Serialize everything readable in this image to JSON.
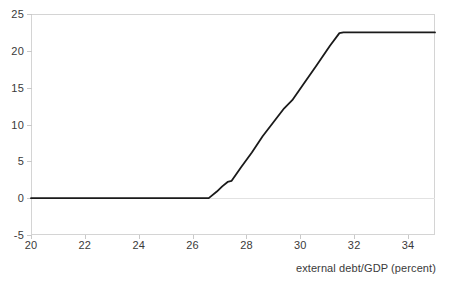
{
  "chart_data": {
    "type": "line",
    "title": "",
    "subtitle": "",
    "xlabel": "external debt/GDP (percent)",
    "ylabel": "",
    "xlim": [
      20,
      35
    ],
    "ylim": [
      -5,
      25
    ],
    "xticks": [
      20,
      22,
      24,
      26,
      28,
      30,
      32,
      34
    ],
    "xtick_labels": [
      "20",
      "22",
      "24",
      "26",
      "28",
      "30",
      "32",
      "34"
    ],
    "yticks": [
      -5,
      0,
      5,
      10,
      15,
      20,
      25
    ],
    "ytick_labels": [
      "-5",
      "0",
      "5",
      "10",
      "15",
      "20",
      "25"
    ],
    "grid": false,
    "legend": null,
    "annotations": [],
    "series": [
      {
        "name": "threshold response",
        "color": "#1a1a1a",
        "line_width": 1.8,
        "x": [
          20.0,
          26.6,
          26.9,
          27.1,
          27.3,
          27.45,
          27.8,
          28.2,
          28.6,
          29.0,
          29.4,
          29.7,
          30.1,
          30.6,
          31.1,
          31.45,
          31.6,
          35.0
        ],
        "y": [
          0.0,
          0.0,
          0.9,
          1.6,
          2.2,
          2.35,
          4.2,
          6.2,
          8.4,
          10.3,
          12.2,
          13.3,
          15.4,
          18.0,
          20.7,
          22.4,
          22.5,
          22.5
        ]
      }
    ]
  },
  "axis": {
    "x_title": "external debt/GDP (percent)",
    "border_color": "#d4d4d4",
    "tick_color": "#c9c9c9",
    "text_color": "#3a3a3a",
    "zero_line_color": "#e2e2e2"
  }
}
